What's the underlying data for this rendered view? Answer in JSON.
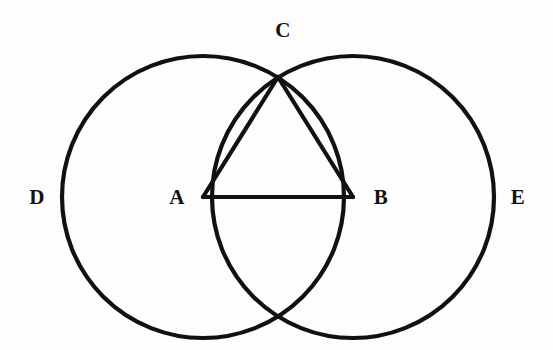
{
  "figure": {
    "background_color": "#fdfdfd",
    "stroke_color": "#111111",
    "label_color": "#111111",
    "stroke_width": 4.2
  },
  "labels": {
    "a": "A",
    "b": "B",
    "c": "C",
    "d": "D",
    "e": "E"
  },
  "chart_data": {
    "type": "diagram",
    "points": [
      {
        "name": "A",
        "label": "A",
        "x": 203,
        "y": 197,
        "role": "center-of-circle-D"
      },
      {
        "name": "B",
        "label": "B",
        "x": 353,
        "y": 197,
        "role": "center-of-circle-E"
      },
      {
        "name": "C",
        "label": "C",
        "x": 278,
        "y": 77,
        "role": "upper-arc-intersection"
      },
      {
        "name": "P",
        "label": "",
        "x": 278,
        "y": 317,
        "role": "lower-arc-intersection"
      }
    ],
    "circles": [
      {
        "name": "D",
        "label": "D",
        "cx": 203,
        "cy": 197,
        "r": 141
      },
      {
        "name": "E",
        "label": "E",
        "cx": 353,
        "cy": 197,
        "r": 141
      }
    ],
    "segments": [
      {
        "name": "AB",
        "from": "A",
        "to": "B"
      },
      {
        "name": "AC",
        "from": "A",
        "to": "C"
      },
      {
        "name": "BC",
        "from": "B",
        "to": "C"
      }
    ],
    "label_positions": [
      {
        "text": "A",
        "x": 177,
        "y": 197
      },
      {
        "text": "B",
        "x": 381,
        "y": 197
      },
      {
        "text": "C",
        "x": 283,
        "y": 30
      },
      {
        "text": "D",
        "x": 37,
        "y": 197
      },
      {
        "text": "E",
        "x": 518,
        "y": 197
      }
    ]
  }
}
